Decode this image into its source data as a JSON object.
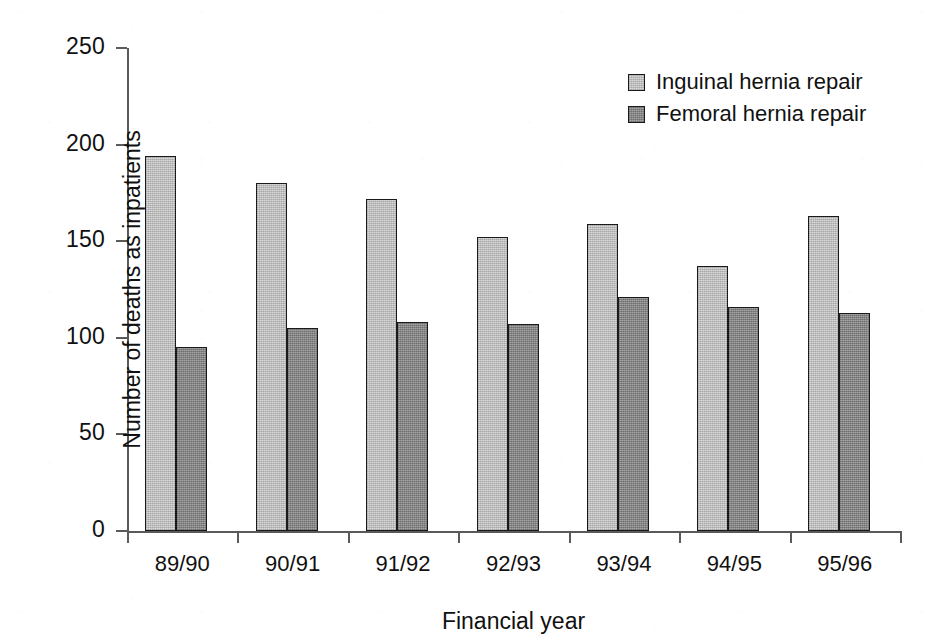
{
  "chart_data": {
    "type": "bar",
    "title": "",
    "xlabel": "Financial year",
    "ylabel": "Number of deaths as inpatients",
    "categories": [
      "89/90",
      "90/91",
      "91/92",
      "92/93",
      "93/94",
      "94/95",
      "95/96"
    ],
    "series": [
      {
        "name": "Inguinal hernia repair",
        "color": "#c9c9c9",
        "values": [
          194,
          180,
          172,
          152,
          159,
          137,
          163
        ]
      },
      {
        "name": "Femoral hernia repair",
        "color": "#8c8c8c",
        "values": [
          95,
          105,
          108,
          107,
          121,
          116,
          113
        ]
      }
    ],
    "ylim": [
      0,
      250
    ],
    "yticks": [
      0,
      50,
      100,
      150,
      200,
      250
    ],
    "ytick_labels": [
      "0",
      "50",
      "100",
      "150",
      "200",
      "250"
    ],
    "grid": false,
    "legend_position": "top-right",
    "legend_entries": [
      "Inguinal hernia repair",
      "Femoral hernia repair"
    ],
    "bar_edge_color": "#1a1a1a",
    "axis_color": "#5a5a5a",
    "background_color": "#ffffff"
  }
}
